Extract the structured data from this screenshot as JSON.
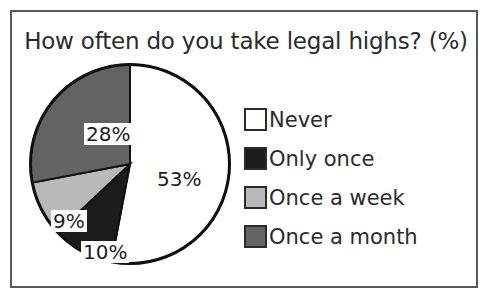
{
  "frame": {
    "border_color": "#555a5e",
    "background": "#ffffff"
  },
  "chart_data": {
    "type": "pie",
    "title": "How often do you take legal highs? (%)",
    "xlabel": "",
    "ylabel": "",
    "unit": "%",
    "legend_position": "right",
    "grid": false,
    "categories": [
      "Never",
      "Only once",
      "Once a week",
      "Once a month"
    ],
    "values": [
      53,
      10,
      9,
      28
    ],
    "labels": [
      "53%",
      "10%",
      "9%",
      "28%"
    ],
    "colors": [
      "#ffffff",
      "#1c1c1c",
      "#b9b9b9",
      "#636363"
    ],
    "slice_outline_color": "#111111",
    "start_angle_deg": 0,
    "direction": "clockwise",
    "slices": [
      {
        "name": "Never",
        "value": 53,
        "label": "53%",
        "color": "#ffffff",
        "label_boxed": false
      },
      {
        "name": "Only once",
        "value": 10,
        "label": "10%",
        "color": "#1c1c1c",
        "label_boxed": true
      },
      {
        "name": "Once a week",
        "value": 9,
        "label": "9%",
        "color": "#b9b9b9",
        "label_boxed": true
      },
      {
        "name": "Once a month",
        "value": 28,
        "label": "28%",
        "color": "#636363",
        "label_boxed": true
      }
    ]
  },
  "legend": {
    "items": [
      {
        "label": "Never",
        "color": "#ffffff"
      },
      {
        "label": "Only once",
        "color": "#1c1c1c"
      },
      {
        "label": "Once a week",
        "color": "#b9b9b9"
      },
      {
        "label": "Once a month",
        "color": "#636363"
      }
    ]
  }
}
